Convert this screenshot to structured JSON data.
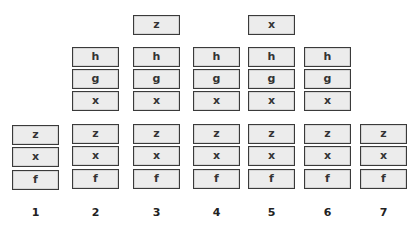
{
  "diagram": {
    "columns": [
      {
        "label": "1",
        "top": [],
        "stack": [
          "z",
          "x",
          "f"
        ]
      },
      {
        "label": "2",
        "top": [
          "h",
          "g",
          "x"
        ],
        "stack": [
          "z",
          "x",
          "f"
        ]
      },
      {
        "label": "3",
        "top": [
          "z",
          "h",
          "g",
          "x"
        ],
        "stack": [
          "z",
          "x",
          "f"
        ]
      },
      {
        "label": "4",
        "top": [
          "h",
          "g",
          "x"
        ],
        "stack": [
          "z",
          "x",
          "f"
        ]
      },
      {
        "label": "5",
        "top": [
          "x",
          "h",
          "g",
          "x"
        ],
        "stack": [
          "z",
          "x",
          "f"
        ]
      },
      {
        "label": "6",
        "top": [
          "h",
          "g",
          "x"
        ],
        "stack": [
          "z",
          "x",
          "f"
        ]
      },
      {
        "label": "7",
        "top": [],
        "stack": [
          "z",
          "x",
          "f"
        ]
      }
    ],
    "colors": {
      "box_fill": "#ececec",
      "box_border": "#3a3a3a",
      "text": "#333333"
    }
  }
}
